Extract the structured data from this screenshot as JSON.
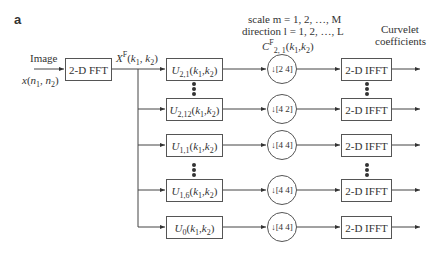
{
  "panel_label": "a",
  "header": {
    "scale_line": "scale m = 1, 2, …, M",
    "direction_line": "direction l = 1, 2, …, L",
    "output_label_1": "Curvelet",
    "output_label_2": "coefficients",
    "coef_label": "C^F_{2,1}(k1,k2)"
  },
  "input": {
    "label_top": "Image",
    "label_bottom": "x(n1, n2)",
    "fft_box": "2-D FFT",
    "fft_output": "X^F(k1, k2)"
  },
  "rows": [
    {
      "filter": "U2,1(k1,k2)",
      "downsample": "[2 4]",
      "ifft": "2-D IFFT"
    },
    {
      "filter": "U2,12(k1,k2)",
      "downsample": "[4 2]",
      "ifft": "2-D IFFT"
    },
    {
      "filter": "U1,1(k1,k2)",
      "downsample": "[4 4]",
      "ifft": "2-D IFFT"
    },
    {
      "filter": "U1,6(k1,k2)",
      "downsample": "[4 4]",
      "ifft": "2-D IFFT"
    },
    {
      "filter": "U0(k1,k2)",
      "downsample": "[4 4]",
      "ifft": "2-D IFFT"
    }
  ]
}
